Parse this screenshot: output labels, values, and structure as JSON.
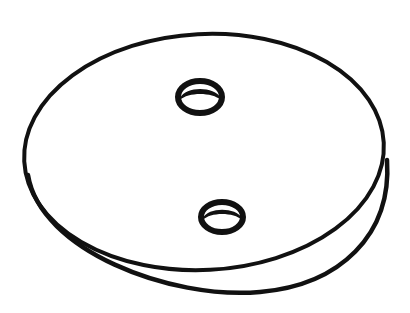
{
  "illustration": {
    "subject": "flat circular disc with two holes",
    "style": "black ink line drawing",
    "colors": {
      "ink": "#111111",
      "background": "#ffffff"
    },
    "disc": {
      "top_face": {
        "cx": 204,
        "cy": 147,
        "rx": 180,
        "ry": 113
      },
      "bottom_edge": {
        "cx": 209,
        "cy": 155,
        "rx": 178,
        "ry": 112
      }
    },
    "holes": [
      {
        "label": "upper-hole",
        "cx": 200,
        "cy": 97,
        "rx": 23,
        "ry": 17
      },
      {
        "label": "lower-hole",
        "cx": 222,
        "cy": 217,
        "rx": 22,
        "ry": 16
      }
    ]
  }
}
